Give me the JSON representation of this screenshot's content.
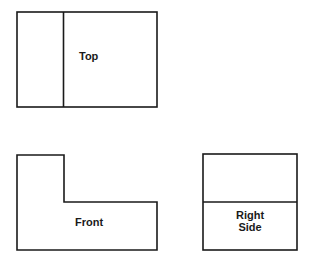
{
  "diagram": {
    "views": {
      "top": {
        "label": "Top"
      },
      "front": {
        "label": "Front"
      },
      "right_side": {
        "label_line1": "Right",
        "label_line2": "Side"
      }
    },
    "colors": {
      "stroke": "#1a1a1a",
      "background": "#ffffff"
    }
  }
}
